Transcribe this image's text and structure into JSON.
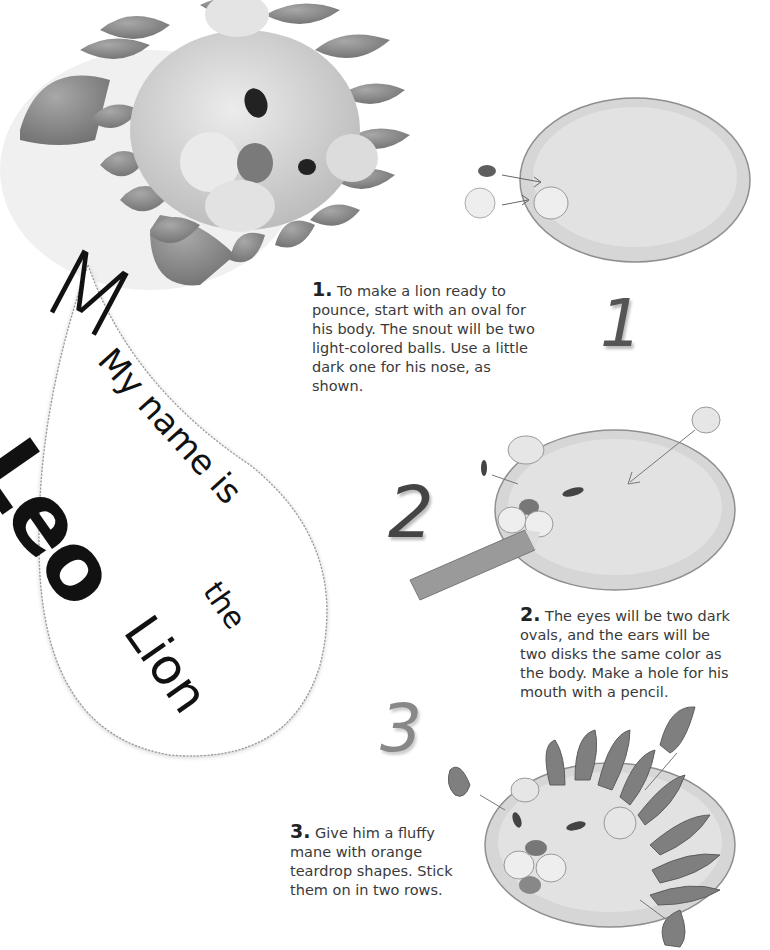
{
  "title": {
    "line1": "My name is",
    "name": "Leo",
    "line3": "the",
    "line4": "Lion"
  },
  "steps": [
    {
      "number": "1.",
      "big_numeral": "1",
      "text": "To make a lion ready to pounce, start with an oval for his body. The snout will be two light-colored balls. Use a little dark one for his nose, as shown."
    },
    {
      "number": "2.",
      "big_numeral": "2",
      "text": "The eyes will be two dark ovals, and the ears will be two disks the same color as the body. Make a hole for his mouth with a pencil."
    },
    {
      "number": "3.",
      "big_numeral": "3",
      "text": "Give him a fluffy mane with orange teardrop shapes. Stick them on in two rows."
    }
  ],
  "colors": {
    "body": "#d9d9d9",
    "body_edge": "#9a9a9a",
    "mane": "#7d7d7d",
    "snout": "#eeeeee",
    "dark": "#4a4a4a",
    "text": "#3a3a3a"
  }
}
